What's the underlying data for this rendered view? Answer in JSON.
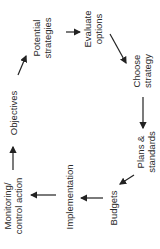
{
  "diagram": {
    "type": "cycle",
    "orientation": "rotated -90deg",
    "nodes": [
      {
        "id": "objectives",
        "lines": [
          "Objectives"
        ]
      },
      {
        "id": "potential-strategies",
        "lines": [
          "Potential",
          "strategies"
        ]
      },
      {
        "id": "evaluate-options",
        "lines": [
          "Evaluate",
          "options"
        ]
      },
      {
        "id": "choose-strategy",
        "lines": [
          "Choose",
          "strategy"
        ]
      },
      {
        "id": "plans-standards",
        "lines": [
          "Plans &",
          "standards"
        ]
      },
      {
        "id": "budgets",
        "lines": [
          "Budgets"
        ]
      },
      {
        "id": "implementation",
        "lines": [
          "Implementation"
        ]
      },
      {
        "id": "monitoring",
        "lines": [
          "Monitoring/",
          "control action"
        ]
      }
    ],
    "edges": [
      [
        "objectives",
        "potential-strategies"
      ],
      [
        "potential-strategies",
        "evaluate-options"
      ],
      [
        "evaluate-options",
        "choose-strategy"
      ],
      [
        "choose-strategy",
        "plans-standards"
      ],
      [
        "plans-standards",
        "budgets"
      ],
      [
        "budgets",
        "implementation"
      ],
      [
        "implementation",
        "monitoring"
      ],
      [
        "monitoring",
        "objectives"
      ]
    ],
    "colors": {
      "text": "#2a2a2a",
      "arrow": "#222222",
      "background": "#ffffff"
    }
  }
}
